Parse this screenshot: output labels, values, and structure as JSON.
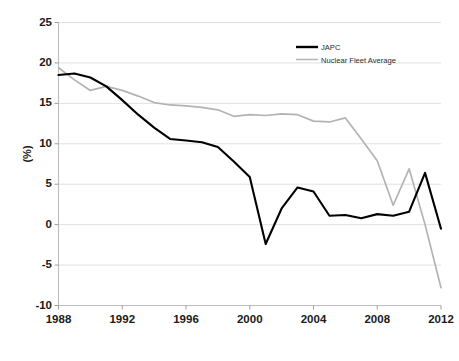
{
  "chart_data": {
    "type": "line",
    "title": "",
    "xlabel": "",
    "ylabel": "(%)",
    "xlim": [
      1988,
      2012
    ],
    "ylim": [
      -10,
      25
    ],
    "ytick_labels": [
      "25",
      "20",
      "15",
      "10",
      "5",
      "0",
      "-5",
      "-10"
    ],
    "ytick_values": [
      25,
      20,
      15,
      10,
      5,
      0,
      -5,
      -10
    ],
    "xtick_labels": [
      "1988",
      "1992",
      "1996",
      "2000",
      "2004",
      "2008",
      "2012"
    ],
    "xtick_values": [
      1988,
      1992,
      1996,
      2000,
      2004,
      2008,
      2012
    ],
    "grid": true,
    "grid_axis": "y",
    "legend_position": "top-right",
    "x": [
      1988,
      1989,
      1990,
      1991,
      1992,
      1993,
      1994,
      1995,
      1996,
      1997,
      1998,
      1999,
      2000,
      2001,
      2002,
      2003,
      2004,
      2005,
      2006,
      2007,
      2008,
      2009,
      2010,
      2011,
      2012
    ],
    "series": [
      {
        "name": "JAPC",
        "color": "#000000",
        "width": 2.1,
        "values": [
          18.5,
          18.7,
          18.2,
          17.1,
          15.4,
          13.6,
          12.0,
          10.6,
          10.4,
          10.2,
          9.6,
          7.8,
          5.9,
          -2.4,
          2.0,
          4.6,
          4.1,
          1.1,
          1.2,
          0.8,
          1.3,
          1.1,
          1.6,
          6.4,
          -0.5
        ]
      },
      {
        "name": "Nuclear Fleet Average",
        "color": "#b3b3b3",
        "width": 1.7,
        "values": [
          19.4,
          17.9,
          16.6,
          17.1,
          16.6,
          15.9,
          15.1,
          14.8,
          14.7,
          14.5,
          14.2,
          13.4,
          13.6,
          13.5,
          13.7,
          13.6,
          12.8,
          12.7,
          13.2,
          10.6,
          7.9,
          2.4,
          6.9,
          0.0,
          -7.8
        ]
      }
    ]
  },
  "legend": {
    "items": [
      {
        "label": "JAPC",
        "color": "#000000"
      },
      {
        "label": "Nuclear Fleet Average",
        "color": "#b3b3b3"
      }
    ]
  },
  "caption": {
    "text": ""
  }
}
